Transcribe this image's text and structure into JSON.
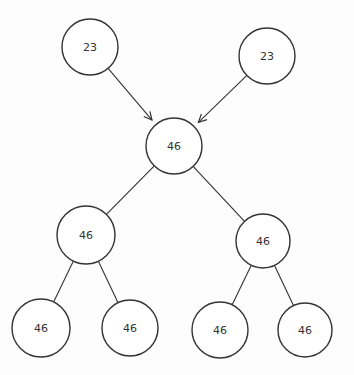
{
  "diagram": {
    "type": "tree",
    "nodes": [
      {
        "id": "a",
        "label": "23",
        "cx": 90,
        "cy": 47,
        "r": 28
      },
      {
        "id": "b",
        "label": "23",
        "cx": 267,
        "cy": 56,
        "r": 28
      },
      {
        "id": "c",
        "label": "46",
        "cx": 174,
        "cy": 146,
        "r": 28
      },
      {
        "id": "d",
        "label": "46",
        "cx": 86,
        "cy": 235,
        "r": 29
      },
      {
        "id": "e",
        "label": "46",
        "cx": 263,
        "cy": 241,
        "r": 27
      },
      {
        "id": "f",
        "label": "46",
        "cx": 41,
        "cy": 328,
        "r": 29
      },
      {
        "id": "g",
        "label": "46",
        "cx": 130,
        "cy": 328,
        "r": 28
      },
      {
        "id": "h",
        "label": "46",
        "cx": 220,
        "cy": 330,
        "r": 28
      },
      {
        "id": "i",
        "label": "46",
        "cx": 305,
        "cy": 330,
        "r": 27
      }
    ],
    "edges": [
      {
        "from": "a",
        "to": "c",
        "arrow": true
      },
      {
        "from": "b",
        "to": "c",
        "arrow": true
      },
      {
        "from": "c",
        "to": "d",
        "arrow": false
      },
      {
        "from": "c",
        "to": "e",
        "arrow": false
      },
      {
        "from": "d",
        "to": "f",
        "arrow": false
      },
      {
        "from": "d",
        "to": "g",
        "arrow": false
      },
      {
        "from": "e",
        "to": "h",
        "arrow": false
      },
      {
        "from": "e",
        "to": "i",
        "arrow": false
      }
    ],
    "stroke_color": "#333333"
  }
}
